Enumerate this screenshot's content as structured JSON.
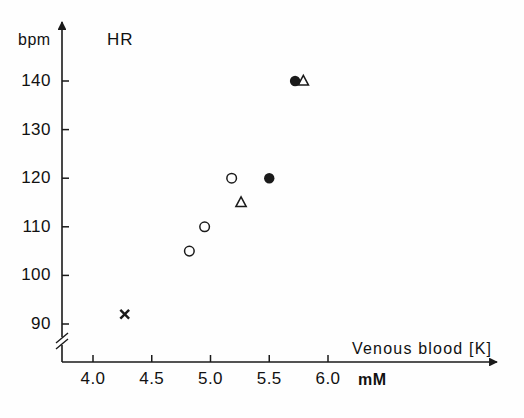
{
  "chart_data": {
    "type": "scatter",
    "title": "HR",
    "xlabel": "Venous blood [K]",
    "x_units": "mM",
    "ylabel": "HR",
    "y_units": "bpm",
    "xlim": [
      3.78,
      6.3
    ],
    "ylim": [
      86,
      147
    ],
    "grid": false,
    "legend": "none",
    "y_axis_break": true,
    "xticks": [
      "4.0",
      "4.5",
      "5.0",
      "5.5",
      "6.0"
    ],
    "xtick_values": [
      4.0,
      4.5,
      5.0,
      5.5,
      6.0
    ],
    "yticks": [
      "90",
      "100",
      "110",
      "120",
      "130",
      "140"
    ],
    "ytick_values": [
      90,
      100,
      110,
      120,
      130,
      140
    ],
    "series": [
      {
        "name": "filled-circle",
        "marker": "filled-circle",
        "points": [
          {
            "x": 5.72,
            "y": 140
          },
          {
            "x": 5.5,
            "y": 120
          }
        ]
      },
      {
        "name": "open-circle",
        "marker": "open-circle",
        "points": [
          {
            "x": 5.18,
            "y": 120
          },
          {
            "x": 4.95,
            "y": 110
          },
          {
            "x": 4.82,
            "y": 105
          }
        ]
      },
      {
        "name": "open-triangle",
        "marker": "open-triangle",
        "points": [
          {
            "x": 5.79,
            "y": 140
          },
          {
            "x": 5.26,
            "y": 115
          }
        ]
      },
      {
        "name": "cross",
        "marker": "cross",
        "points": [
          {
            "x": 4.27,
            "y": 92
          }
        ]
      }
    ]
  },
  "axes": {
    "y_unit_label": "bpm",
    "y_title": "HR",
    "x_title": "Venous blood [K]",
    "x_unit_label": "mM"
  },
  "colors": {
    "ink": "#1a1a1a",
    "background": "#fefefe"
  }
}
